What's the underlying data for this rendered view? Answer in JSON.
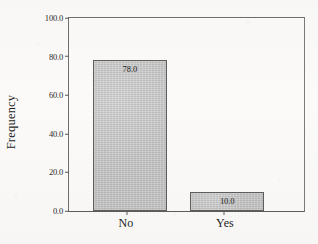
{
  "chart_data": {
    "type": "bar",
    "title": "",
    "subtitle": "",
    "xlabel": "",
    "ylabel": "Frequency",
    "categories": [
      "No",
      "Yes"
    ],
    "values": [
      78.0,
      10.0
    ],
    "value_labels": [
      "78.0",
      "10.0"
    ],
    "ylim": [
      0,
      100
    ],
    "yticks": [
      0,
      20,
      40,
      60,
      80,
      100
    ],
    "ytick_labels": [
      "0.0",
      "20.0",
      "40.0",
      "60.0",
      "80.0",
      "100.0"
    ],
    "grid": false,
    "legend": false,
    "legend_position": "none",
    "bar_fill_color": "#c3c3c3",
    "bar_border_color": "#5e5e5e",
    "axis_color": "#6f6f6f",
    "background_color": "#fbfaf8",
    "text_color": "#1d1d1d"
  }
}
